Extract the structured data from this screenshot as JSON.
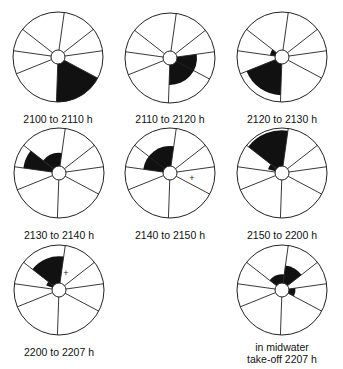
{
  "diagram": {
    "radius": 45,
    "hub_radius": 7,
    "spoke_angles_deg": [
      82,
      38,
      8,
      -28,
      -92,
      -158,
      172,
      142
    ],
    "fill_color": "#111111",
    "line_color": "#222222",
    "panels": [
      {
        "id": "p1",
        "label": "2100 to 2110 h",
        "cx": 58,
        "cy": 57,
        "label_y": 113,
        "fills": [
          {
            "from": -92,
            "to": -28,
            "r": 1.0
          }
        ],
        "marks": []
      },
      {
        "id": "p2",
        "label": "2110 to 2120 h",
        "cx": 170,
        "cy": 58,
        "label_y": 113,
        "fills": [
          {
            "from": -92,
            "to": 8,
            "r": 0.6
          }
        ],
        "marks": []
      },
      {
        "id": "p3",
        "label": "2120 to 2130 h",
        "cx": 282,
        "cy": 57,
        "label_y": 113,
        "fills": [
          {
            "from": -158,
            "to": -92,
            "r": 0.85
          },
          {
            "from": 142,
            "to": 172,
            "r": 0.27
          }
        ],
        "marks": []
      },
      {
        "id": "p4",
        "label": "2130 to 2140 h",
        "cx": 59,
        "cy": 173,
        "label_y": 229,
        "fills": [
          {
            "from": 142,
            "to": 172,
            "r": 0.8
          },
          {
            "from": 82,
            "to": 142,
            "r": 0.45
          }
        ],
        "marks": []
      },
      {
        "id": "p5",
        "label": "2140 to 2150 h",
        "cx": 170,
        "cy": 173,
        "label_y": 229,
        "fills": [
          {
            "from": 82,
            "to": 172,
            "r": 0.6
          }
        ],
        "marks": [
          {
            "dx": 22,
            "dy": 5,
            "glyph": "+"
          }
        ]
      },
      {
        "id": "p6",
        "label": "2150 to 2200 h",
        "cx": 282,
        "cy": 173,
        "label_y": 229,
        "fills": [
          {
            "from": 82,
            "to": 142,
            "r": 0.95
          },
          {
            "from": 142,
            "to": 165,
            "r": 0.32
          }
        ],
        "marks": []
      },
      {
        "id": "p7",
        "label": "2200 to 2207 h",
        "cx": 59,
        "cy": 290,
        "label_y": 346,
        "fills": [
          {
            "from": 82,
            "to": 142,
            "r": 0.75
          },
          {
            "from": 142,
            "to": 160,
            "r": 0.3
          }
        ],
        "marks": [
          {
            "dx": 7,
            "dy": -17,
            "glyph": "+"
          }
        ]
      },
      {
        "id": "p8",
        "label": "in midwater\ntake-off 2207 h",
        "label_lines": [
          "in midwater",
          "take-off 2207 h"
        ],
        "cx": 282,
        "cy": 290,
        "label_y": 341,
        "fills": [
          {
            "from": 38,
            "to": 82,
            "r": 0.55
          },
          {
            "from": 82,
            "to": 142,
            "r": 0.35
          },
          {
            "from": -28,
            "to": 8,
            "r": 0.3
          }
        ],
        "marks": []
      }
    ]
  }
}
